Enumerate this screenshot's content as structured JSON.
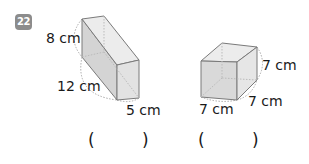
{
  "problem": {
    "number": "22",
    "figures": [
      {
        "name": "cuboid",
        "dimensions": {
          "height": "8 cm",
          "length": "12 cm",
          "width": "5 cm"
        },
        "answer_open": "(",
        "answer_close": ")"
      },
      {
        "name": "cube",
        "dimensions": {
          "height": "7 cm",
          "depth": "7 cm",
          "width": "7 cm"
        },
        "answer_open": "(",
        "answer_close": ")"
      }
    ]
  },
  "colors": {
    "badge": "#8c8c8c",
    "face": "#d9d9d9",
    "edge": "#7a7a7a"
  }
}
